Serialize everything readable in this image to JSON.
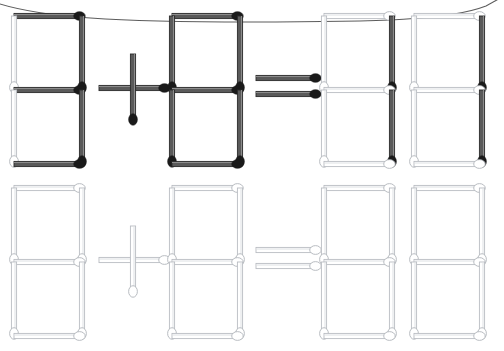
{
  "image": {
    "kind": "matchstick-puzzle",
    "width": 504,
    "height": 351,
    "background_color": "#ffffff",
    "title": "Matchstick equation puzzle",
    "description": "Seven-segment matchstick digits forming an addition equation, shown in a dark filled rendering on the top row and a light outline rendering on the bottom row."
  },
  "frame": {
    "name": "rounded-border-arc",
    "color": "#4a4a4a",
    "stroke_width": 1.1,
    "visible": true,
    "note": "Thin curved page-border arc sweeping across the very top of the image."
  },
  "colors": {
    "match_dark_stick": "#5a5a5a",
    "match_dark_stick_edge": "#2b2b2b",
    "match_dark_head": "#1a1a1a",
    "match_light_stick": "#ffffff",
    "match_light_stick_edge": "#b9bcc2",
    "match_light_head_fill": "#ffffff",
    "match_light_head_edge": "#b0b4ba"
  },
  "rows": [
    {
      "id": "row-top",
      "style": "dark",
      "label": "Top equation row (filled dark matches)",
      "equation_text": "8 + 8 = 88",
      "groups": [
        {
          "id": "top-digit-1",
          "type": "digit",
          "value": "8",
          "tone": "dark",
          "x": 14,
          "y": 16,
          "w": 68,
          "h": 148,
          "segments": [
            "top",
            "top-left",
            "top-right",
            "middle",
            "bottom-left",
            "bottom-right",
            "bottom"
          ],
          "segment_tones": {
            "top": "dark",
            "top-left": "light",
            "top-right": "dark",
            "middle": "dark",
            "bottom-left": "light",
            "bottom-right": "dark",
            "bottom": "dark"
          }
        },
        {
          "id": "top-operator-plus",
          "type": "operator",
          "value": "+",
          "tone": "dark",
          "cx": 133,
          "cy": 88,
          "arm": 34,
          "sticks": [
            "horizontal",
            "vertical"
          ]
        },
        {
          "id": "top-digit-2",
          "type": "digit",
          "value": "8",
          "tone": "dark",
          "x": 172,
          "y": 16,
          "w": 68,
          "h": 148,
          "segments": [
            "top",
            "top-left",
            "top-right",
            "middle",
            "bottom-left",
            "bottom-right",
            "bottom"
          ],
          "segment_tones": {
            "top": "dark",
            "top-left": "dark",
            "top-right": "dark",
            "middle": "dark",
            "bottom-left": "dark",
            "bottom-right": "dark",
            "bottom": "dark"
          }
        },
        {
          "id": "top-operator-equals",
          "type": "operator",
          "value": "=",
          "tone": "dark",
          "x": 256,
          "y": 78,
          "w": 62,
          "gap": 16,
          "sticks": [
            "upper-bar",
            "lower-bar"
          ]
        },
        {
          "id": "top-digit-3",
          "type": "digit",
          "value": "8",
          "tone": "mixed",
          "x": 324,
          "y": 16,
          "w": 68,
          "h": 148,
          "segments": [
            "top",
            "top-left",
            "top-right",
            "middle",
            "bottom-left",
            "bottom-right",
            "bottom"
          ],
          "segment_tones": {
            "top": "light",
            "top-left": "light",
            "top-right": "dark",
            "middle": "light",
            "bottom-left": "light",
            "bottom-right": "dark",
            "bottom": "light"
          }
        },
        {
          "id": "top-digit-4",
          "type": "digit",
          "value": "8",
          "tone": "mixed",
          "x": 414,
          "y": 16,
          "w": 68,
          "h": 148,
          "segments": [
            "top",
            "top-left",
            "top-right",
            "middle",
            "bottom-left",
            "bottom-right",
            "bottom"
          ],
          "segment_tones": {
            "top": "light",
            "top-left": "light",
            "top-right": "dark",
            "middle": "light",
            "bottom-left": "light",
            "bottom-right": "dark",
            "bottom": "light"
          }
        }
      ]
    },
    {
      "id": "row-bottom",
      "style": "light",
      "label": "Bottom equation row (outline light matches)",
      "equation_text": "8 + 8 = 88",
      "groups": [
        {
          "id": "bottom-digit-1",
          "type": "digit",
          "value": "8",
          "tone": "light",
          "x": 14,
          "y": 188,
          "w": 68,
          "h": 148,
          "segments": [
            "top",
            "top-left",
            "top-right",
            "middle",
            "bottom-left",
            "bottom-right",
            "bottom"
          ],
          "segment_tones": {
            "top": "light",
            "top-left": "light",
            "top-right": "light",
            "middle": "light",
            "bottom-left": "light",
            "bottom-right": "light",
            "bottom": "light"
          }
        },
        {
          "id": "bottom-operator-plus",
          "type": "operator",
          "value": "+",
          "tone": "light",
          "cx": 133,
          "cy": 260,
          "arm": 34,
          "sticks": [
            "horizontal",
            "vertical"
          ]
        },
        {
          "id": "bottom-digit-2",
          "type": "digit",
          "value": "8",
          "tone": "light",
          "x": 172,
          "y": 188,
          "w": 68,
          "h": 148,
          "segments": [
            "top",
            "top-left",
            "top-right",
            "middle",
            "bottom-left",
            "bottom-right",
            "bottom"
          ],
          "segment_tones": {
            "top": "light",
            "top-left": "light",
            "top-right": "light",
            "middle": "light",
            "bottom-left": "light",
            "bottom-right": "light",
            "bottom": "light"
          }
        },
        {
          "id": "bottom-operator-equals",
          "type": "operator",
          "value": "=",
          "tone": "light",
          "x": 256,
          "y": 250,
          "w": 62,
          "gap": 16,
          "sticks": [
            "upper-bar",
            "lower-bar"
          ]
        },
        {
          "id": "bottom-digit-3",
          "type": "digit",
          "value": "8",
          "tone": "light",
          "x": 324,
          "y": 188,
          "w": 68,
          "h": 148,
          "segments": [
            "top",
            "top-left",
            "top-right",
            "middle",
            "bottom-left",
            "bottom-right",
            "bottom"
          ],
          "segment_tones": {
            "top": "light",
            "top-left": "light",
            "top-right": "light",
            "middle": "light",
            "bottom-left": "light",
            "bottom-right": "light",
            "bottom": "light"
          }
        },
        {
          "id": "bottom-digit-4",
          "type": "digit",
          "value": "8",
          "tone": "light",
          "x": 414,
          "y": 188,
          "w": 68,
          "h": 148,
          "segments": [
            "top",
            "top-left",
            "top-right",
            "middle",
            "bottom-left",
            "bottom-right",
            "bottom"
          ],
          "segment_tones": {
            "top": "light",
            "top-left": "light",
            "top-right": "light",
            "middle": "light",
            "bottom-left": "light",
            "bottom-right": "light",
            "bottom": "light"
          }
        }
      ]
    }
  ]
}
